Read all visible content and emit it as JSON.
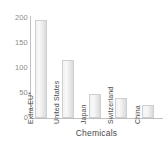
{
  "chart_data": {
    "type": "bar",
    "title": "",
    "subtitle": "",
    "xlabel": "Chemicals",
    "ylabel": "",
    "categories": [
      "Extra-EU*",
      "United States",
      "Japan",
      "Switzerland",
      "China"
    ],
    "values": [
      197,
      116,
      48,
      40,
      26
    ],
    "ylim": [
      0,
      200
    ],
    "yticks": [
      0,
      50,
      100,
      150,
      200
    ],
    "ytick_labels": [
      "0",
      "50",
      "100",
      "150",
      "200"
    ],
    "grid": false,
    "legend": null,
    "legend_position": "none",
    "annotations": [],
    "bar_fill_color": "#ededed",
    "bar_border_color": "#cfcfcf",
    "axis_color": "#bfbfbf",
    "label_color": "#4a4a4a",
    "tick_label_color": "#8a8a8a",
    "category_label_orientation": "vertical"
  }
}
